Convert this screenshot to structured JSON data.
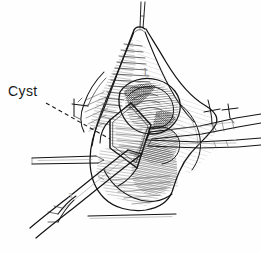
{
  "figure": {
    "kind": "surgical-line-drawing",
    "background_color": "#fefefe",
    "ink_color": "#141414",
    "width": 261,
    "height": 253,
    "caption_visible": false
  },
  "annotations": {
    "cyst_label": "Cyst",
    "step_marker": "1",
    "instrument_marker": "3"
  },
  "structures": {
    "tissue_name": "everted-tissue-cone",
    "opening_name": "diamond-incision-opening",
    "cyst_name": "cyst-wall-shaded"
  },
  "instruments": {
    "left_probe": "left-probe-retractor",
    "lower_forceps": "lower-forceps",
    "right_forceps": "right-forceps"
  },
  "sutures": {
    "apex": "apex-suture-thread",
    "left": "left-stay-suture",
    "right": "right-stay-suture"
  },
  "baseline": "bottom-horizon-line"
}
